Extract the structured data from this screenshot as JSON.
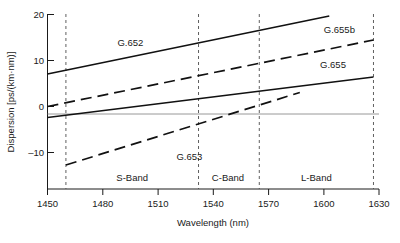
{
  "chart_data": {
    "type": "line",
    "title": "",
    "xlabel": "Wavelength (nm)",
    "ylabel": "Dispersion [ps/(km·nm)]",
    "xlim": [
      1450,
      1630
    ],
    "ylim": [
      -15,
      20
    ],
    "xticks": [
      1450,
      1480,
      1510,
      1540,
      1570,
      1600,
      1630
    ],
    "yticks": [
      20,
      10,
      0,
      -10
    ],
    "xtick_labels": [
      "1450",
      "1480",
      "1510",
      "1540",
      "1570",
      "1600",
      "1630"
    ],
    "ytick_labels": [
      "20",
      "10",
      "0",
      "–10"
    ],
    "grid": false,
    "legend_position": "inline-annotations",
    "zero_line": 0,
    "series": [
      {
        "name": "G.652",
        "style": "solid",
        "x": [
          1450,
          1603
        ],
        "values": [
          8.0,
          19.6
        ],
        "label_x": 1488,
        "label_y": 13.7
      },
      {
        "name": "G.655b",
        "style": "dashed",
        "x": [
          1450,
          1627
        ],
        "values": [
          1.5,
          14.8
        ],
        "label_x": 1600,
        "label_y": 16.2
      },
      {
        "name": "G.655",
        "style": "solid",
        "x": [
          1450,
          1627
        ],
        "values": [
          -0.7,
          7.4
        ],
        "label_x": 1598,
        "label_y": 9.2
      },
      {
        "name": "G.653",
        "style": "dashed",
        "x": [
          1460,
          1587
        ],
        "values": [
          -10.2,
          4.3
        ],
        "label_x": 1520,
        "label_y": -9.2
      }
    ],
    "bands": [
      {
        "name": "S-Band",
        "start": 1460,
        "end": 1532,
        "label_x": 1496,
        "label_y": -13.3
      },
      {
        "name": "C-Band",
        "start": 1532,
        "end": 1565,
        "label_x": 1548,
        "label_y": -13.3
      },
      {
        "name": "L-Band",
        "start": 1565,
        "end": 1627,
        "label_x": 1596,
        "label_y": -13.3
      }
    ],
    "band_dividers": [
      1460,
      1532,
      1565,
      1627
    ]
  }
}
